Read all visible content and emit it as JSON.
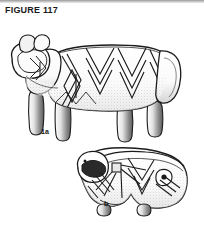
{
  "page": {
    "width": 204,
    "height": 229,
    "background_color": "#ffffff",
    "scan_edge_color": "#9a9a9a",
    "ink_color": "#1b1b1b"
  },
  "caption": {
    "text": "FIGURE 117"
  },
  "figures": [
    {
      "id": "figure-1a",
      "label": "1a",
      "subject": "zoomorphic ceramic vessel, complete quadruped",
      "orientation": "head at left, tail at right, standing on four legs",
      "decoration": "incised chevron and zigzag bands with stippled shading"
    },
    {
      "id": "figure-b",
      "label": "b",
      "subject": "zoomorphic ceramic vessel fragment, animal head and forequarters",
      "orientation": "muzzle at left, body broken at right",
      "decoration": "incised chevron, lozenge and radiating line motifs with stippled shading"
    }
  ],
  "icons": {
    "scan_edge": "scan-edge-bar"
  }
}
